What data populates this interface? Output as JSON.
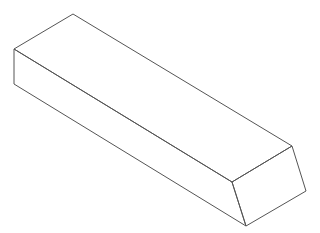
{
  "diagram": {
    "type": "isometric-rectangular-prism",
    "stroke_color": "#555555",
    "background": "#ffffff",
    "vertices": {
      "top_back_left": [
        73,
        14
      ],
      "top_front_left": [
        14,
        49
      ],
      "bottom_front_left": [
        14,
        84
      ],
      "top_back_right": [
        292,
        146
      ],
      "top_front_right": [
        232,
        182
      ],
      "bottom_front_right": [
        246,
        226
      ],
      "bottom_back_right": [
        306,
        191
      ]
    }
  }
}
